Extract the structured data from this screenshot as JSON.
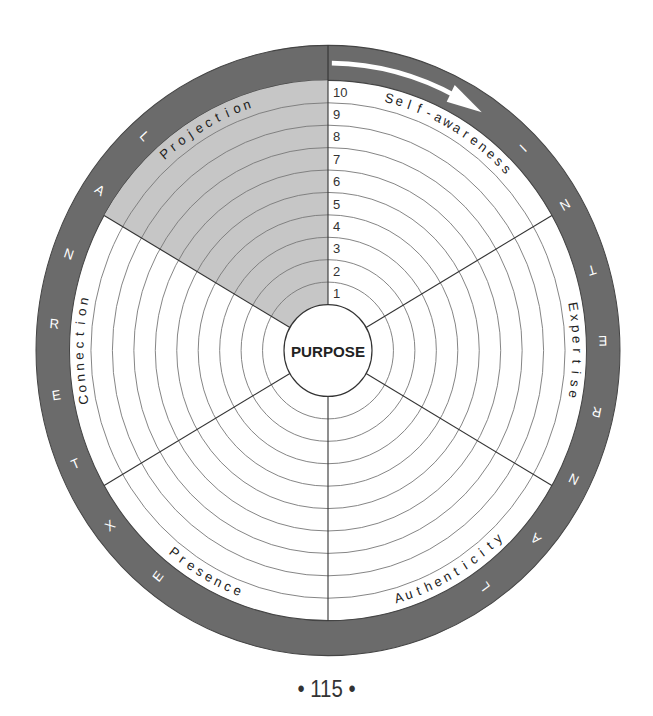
{
  "diagram": {
    "center_label": "PURPOSE",
    "scale_numbers": [
      "1",
      "2",
      "3",
      "4",
      "5",
      "6",
      "7",
      "8",
      "9",
      "10"
    ],
    "sectors": [
      {
        "label": "Self-awareness",
        "start_deg": 0,
        "end_deg": 60,
        "shaded": false
      },
      {
        "label": "Expertise",
        "start_deg": 60,
        "end_deg": 120,
        "shaded": false
      },
      {
        "label": "Authenticity",
        "start_deg": 120,
        "end_deg": 180,
        "shaded": false
      },
      {
        "label": "Presence",
        "start_deg": 180,
        "end_deg": 240,
        "shaded": false
      },
      {
        "label": "Connection",
        "start_deg": 240,
        "end_deg": 300,
        "shaded": false
      },
      {
        "label": "Projection",
        "start_deg": 300,
        "end_deg": 360,
        "shaded": true
      }
    ],
    "outer_ring": {
      "internal_label": "INTERNAL",
      "internal_letters": [
        "I",
        "N",
        "T",
        "E",
        "R",
        "N",
        "A",
        "L"
      ],
      "external_label": "EXTERNAL",
      "external_letters": [
        "E",
        "X",
        "T",
        "E",
        "R",
        "N",
        "A",
        "L"
      ],
      "arrow": "clockwise-arrow"
    },
    "colors": {
      "ring_band": "#6b6b6b",
      "shaded_sector": "#c6c6c6",
      "background": "#ffffff",
      "lines": "#555555"
    }
  },
  "page": {
    "number_text": "• 115 •"
  }
}
